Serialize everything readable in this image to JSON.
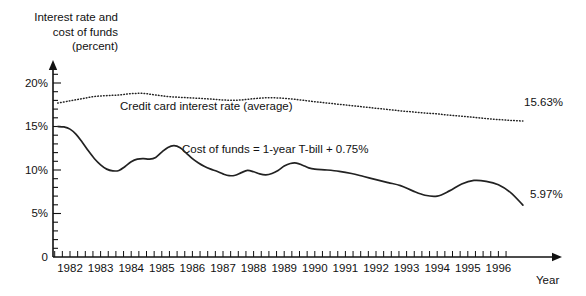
{
  "chart_data": {
    "type": "line",
    "title": "Interest rate and\ncost of funds\n(percent)",
    "title_lines": [
      "Interest rate and",
      "cost of funds",
      "(percent)"
    ],
    "xlabel": "Year",
    "ylabel": "Interest rate and cost of funds (percent)",
    "grid": false,
    "legend_position": "inline-annotations",
    "xlim": [
      1981.5,
      1997.0
    ],
    "ylim": [
      0,
      21.5
    ],
    "ytick_labels": [
      "0",
      "5%",
      "10%",
      "15%",
      "20%"
    ],
    "ytick_values": [
      0,
      5,
      10,
      15,
      20
    ],
    "yminor_step": 1,
    "xtick_labels": [
      "1982",
      "1983",
      "1984",
      "1985",
      "1986",
      "1987",
      "1988",
      "1989",
      "1990",
      "1991",
      "1992",
      "1993",
      "1994",
      "1995",
      "1996"
    ],
    "xtick_values": [
      1982,
      1983,
      1984,
      1985,
      1986,
      1987,
      1988,
      1989,
      1990,
      1991,
      1992,
      1993,
      1994,
      1995,
      1996
    ],
    "xminor_per_year": 4,
    "annotations": [
      {
        "name": "credit-card-annotation",
        "text": "Credit card interest rate (average)"
      },
      {
        "name": "cost-of-funds-annotation",
        "text": "Cost of funds = 1-year T-bill + 0.75%"
      }
    ],
    "end_labels": [
      {
        "name": "credit-card-end-label",
        "text": "15.63%",
        "value": 15.63
      },
      {
        "name": "cost-of-funds-end-label",
        "text": "5.97%",
        "value": 5.97
      }
    ],
    "series": [
      {
        "name": "Credit card interest rate (average)",
        "style": "dotted",
        "color": "#222222",
        "x": [
          1981.6,
          1982.0,
          1982.4,
          1982.8,
          1983.2,
          1983.6,
          1984.0,
          1984.4,
          1984.8,
          1985.2,
          1985.6,
          1986.0,
          1986.4,
          1986.8,
          1987.2,
          1987.6,
          1988.0,
          1988.4,
          1988.8,
          1989.2,
          1989.6,
          1990.0,
          1990.4,
          1990.8,
          1991.2,
          1991.6,
          1992.0,
          1992.4,
          1992.8,
          1993.2,
          1993.6,
          1994.0,
          1994.4,
          1994.8,
          1995.2,
          1995.6,
          1996.0,
          1996.4,
          1996.8
        ],
        "y": [
          17.7,
          17.95,
          18.2,
          18.45,
          18.55,
          18.62,
          18.78,
          18.8,
          18.62,
          18.45,
          18.35,
          18.28,
          18.2,
          18.1,
          18.02,
          18.05,
          18.2,
          18.3,
          18.28,
          18.18,
          18.02,
          17.85,
          17.7,
          17.55,
          17.4,
          17.25,
          17.1,
          16.95,
          16.8,
          16.68,
          16.55,
          16.45,
          16.3,
          16.18,
          16.05,
          15.92,
          15.8,
          15.7,
          15.63
        ]
      },
      {
        "name": "Cost of funds = 1-year T-bill + 0.75%",
        "style": "solid",
        "color": "#222222",
        "x": [
          1981.6,
          1981.8,
          1982.0,
          1982.2,
          1982.4,
          1982.6,
          1982.8,
          1983.0,
          1983.2,
          1983.4,
          1983.6,
          1983.8,
          1984.0,
          1984.2,
          1984.4,
          1984.6,
          1984.8,
          1985.0,
          1985.2,
          1985.4,
          1985.6,
          1985.8,
          1986.0,
          1986.2,
          1986.4,
          1986.6,
          1986.8,
          1987.0,
          1987.2,
          1987.4,
          1987.6,
          1987.8,
          1988.0,
          1988.2,
          1988.4,
          1988.6,
          1988.8,
          1989.0,
          1989.2,
          1989.4,
          1989.6,
          1989.8,
          1990.0,
          1990.4,
          1990.8,
          1991.2,
          1991.6,
          1992.0,
          1992.4,
          1992.8,
          1993.2,
          1993.6,
          1994.0,
          1994.4,
          1994.8,
          1995.2,
          1995.6,
          1996.0,
          1996.4,
          1996.8
        ],
        "y": [
          15.0,
          14.95,
          14.7,
          14.1,
          13.2,
          12.2,
          11.3,
          10.6,
          10.1,
          9.9,
          9.95,
          10.4,
          10.95,
          11.25,
          11.3,
          11.25,
          11.45,
          12.05,
          12.6,
          12.8,
          12.55,
          11.95,
          11.3,
          10.8,
          10.4,
          10.1,
          9.85,
          9.55,
          9.35,
          9.4,
          9.7,
          9.95,
          9.8,
          9.55,
          9.45,
          9.6,
          9.95,
          10.45,
          10.75,
          10.8,
          10.55,
          10.25,
          10.1,
          10.0,
          9.85,
          9.6,
          9.25,
          8.9,
          8.55,
          8.2,
          7.6,
          7.1,
          7.0,
          7.6,
          8.4,
          8.8,
          8.7,
          8.3,
          7.4,
          5.97
        ]
      }
    ]
  }
}
